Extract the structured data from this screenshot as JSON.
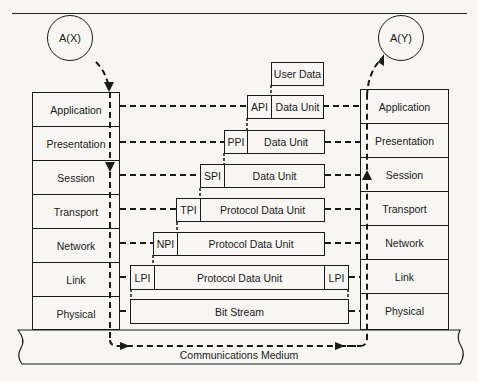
{
  "diagram": {
    "type": "OSI reference model data flow",
    "endpoints": {
      "source": "A(X)",
      "destination": "A(Y)"
    },
    "left_stack": {
      "layers": [
        "Application",
        "Presentation",
        "Session",
        "Transport",
        "Network",
        "Link",
        "Physical"
      ]
    },
    "right_stack": {
      "layers": [
        "Application",
        "Presentation",
        "Session",
        "Transport",
        "Network",
        "Link",
        "Physical"
      ]
    },
    "data_units": {
      "user_data": "User Data",
      "application": {
        "header": "API",
        "body": "Data Unit"
      },
      "presentation": {
        "header": "PPI",
        "body": "Data Unit"
      },
      "session": {
        "header": "SPI",
        "body": "Data Unit"
      },
      "transport": {
        "header": "TPI",
        "body": "Protocol Data Unit"
      },
      "network": {
        "header": "NPI",
        "body": "Protocol Data Unit"
      },
      "link": {
        "header": "LPI",
        "body": "Protocol Data Unit",
        "trailer": "LPI"
      },
      "physical": {
        "body": "Bit Stream"
      }
    },
    "medium": "Communications Medium"
  }
}
